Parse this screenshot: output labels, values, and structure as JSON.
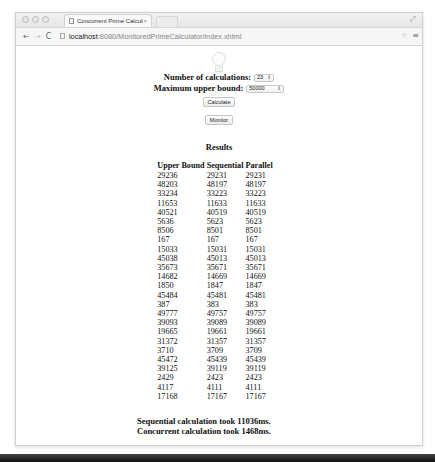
{
  "browser": {
    "tab_title": "Concurrent Prime Calculat",
    "tab_close": "×",
    "url_host": "localhost",
    "url_rest": ":8080/MonitoredPrimeCalculator/index.xhtml",
    "icons": {
      "back": "←",
      "forward": "→",
      "reload": "C",
      "star": "☆",
      "menu": "≡",
      "fullscreen": "⤢"
    }
  },
  "form": {
    "num_calculations_label": "Number of calculations:",
    "num_calculations_value": "23",
    "max_upper_bound_label": "Maximum upper bound:",
    "max_upper_bound_value": "50000",
    "calculate_label": "Calculate",
    "monitor_label": "Monitor",
    "select_arrow": "⇕"
  },
  "results": {
    "title": "Results",
    "columns": [
      "Upper Bound",
      "Sequential",
      "Parallel"
    ],
    "rows": [
      [
        "29236",
        "29231",
        "29231"
      ],
      [
        "48203",
        "48197",
        "48197"
      ],
      [
        "33234",
        "33223",
        "33223"
      ],
      [
        "11653",
        "11633",
        "11633"
      ],
      [
        "40521",
        "40519",
        "40519"
      ],
      [
        "5636",
        "5623",
        "5623"
      ],
      [
        "8506",
        "8501",
        "8501"
      ],
      [
        "167",
        "167",
        "167"
      ],
      [
        "15033",
        "15031",
        "15031"
      ],
      [
        "45038",
        "45013",
        "45013"
      ],
      [
        "35673",
        "35671",
        "35671"
      ],
      [
        "14682",
        "14669",
        "14669"
      ],
      [
        "1850",
        "1847",
        "1847"
      ],
      [
        "45484",
        "45481",
        "45481"
      ],
      [
        "387",
        "383",
        "383"
      ],
      [
        "49777",
        "49757",
        "49757"
      ],
      [
        "39093",
        "39089",
        "39089"
      ],
      [
        "19665",
        "19661",
        "19661"
      ],
      [
        "31372",
        "31357",
        "31357"
      ],
      [
        "3710",
        "3709",
        "3709"
      ],
      [
        "45472",
        "45439",
        "45439"
      ],
      [
        "39125",
        "39119",
        "39119"
      ],
      [
        "2429",
        "2423",
        "2423"
      ],
      [
        "4117",
        "4111",
        "4111"
      ],
      [
        "17168",
        "17167",
        "17167"
      ]
    ]
  },
  "summary": {
    "sequential": "Sequential calculation took 11036ms.",
    "concurrent": "Concurrent calculation took 1468ms."
  }
}
